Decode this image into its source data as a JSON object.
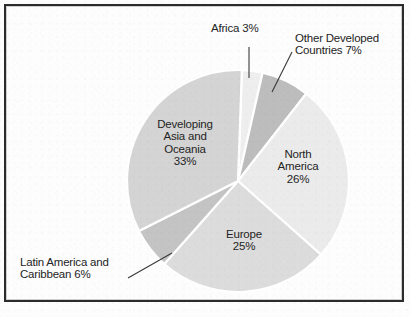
{
  "chart_data": {
    "type": "pie",
    "title": "",
    "subtitle": "",
    "xlabel": "",
    "ylabel": "",
    "legend": "none",
    "grid": false,
    "unit": "%",
    "center": {
      "x": 238,
      "y": 181
    },
    "radius": 111,
    "start_angle_deg": -88,
    "categories": [
      "Africa",
      "Other Developed Countries",
      "North America",
      "Europe",
      "Latin America and Caribbean",
      "Developing Asia and Oceania"
    ],
    "values": [
      3,
      7,
      26,
      25,
      6,
      33
    ],
    "slices": [
      {
        "name": "Africa",
        "label": "Africa 3%",
        "value": 3,
        "value_text": "3%",
        "color": "#eeeeee",
        "label_placement": "callout",
        "label_lines": [
          "Africa 3%"
        ]
      },
      {
        "name": "Other Developed Countries",
        "label": "Other Developed Countries 7%",
        "value": 7,
        "value_text": "7%",
        "color": "#bdbdbd",
        "label_placement": "callout",
        "label_lines": [
          "Other Developed",
          "Countries 7%"
        ]
      },
      {
        "name": "North America",
        "label": "North America 26%",
        "value": 26,
        "value_text": "26%",
        "color": "#ebebeb",
        "label_placement": "inside",
        "label_lines": [
          "North",
          "America",
          "26%"
        ]
      },
      {
        "name": "Europe",
        "label": "Europe 25%",
        "value": 25,
        "value_text": "25%",
        "color": "#dcdcdc",
        "label_placement": "inside",
        "label_lines": [
          "Europe",
          "25%"
        ]
      },
      {
        "name": "Latin America and Caribbean",
        "label": "Latin America and Caribbean 6%",
        "value": 6,
        "value_text": "6%",
        "color": "#c4c4c4",
        "label_placement": "callout",
        "label_lines": [
          "Latin America and",
          "Caribbean 6%"
        ]
      },
      {
        "name": "Developing Asia and Oceania",
        "label": "Developing Asia and Oceania 33%",
        "value": 33,
        "value_text": "33%",
        "color": "#d4d4d4",
        "label_placement": "inside",
        "label_lines": [
          "Developing",
          "Asia and",
          "Oceania",
          "33%"
        ]
      }
    ]
  },
  "labels": {
    "developing_asia": "Developing\nAsia and\nOceania\n33%",
    "north_america": "North\nAmerica\n26%",
    "europe": "Europe\n25%",
    "africa": "Africa 3%",
    "other_developed": "Other Developed\nCountries 7%",
    "latin_america": "Latin America and\nCaribbean 6%"
  },
  "style": {
    "separator_color": "#ffffff",
    "text_color": "#242424",
    "frame_color": "#2b2b2b",
    "background": "#fdfdfd",
    "leader_line_color": "#3a3a3a"
  }
}
